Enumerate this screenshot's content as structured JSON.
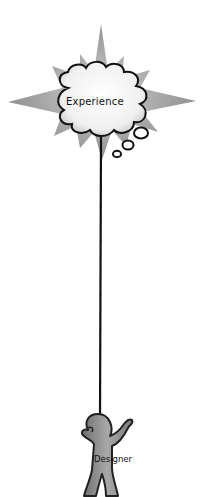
{
  "diagram": {
    "thought_bubble": {
      "label": "Experience"
    },
    "figure": {
      "label": "Designer"
    },
    "colors": {
      "starburst": "#9a9a9a",
      "cloud_fill": "#f4f4f4",
      "outline": "#111111",
      "figure_fill": "#8c8c8c"
    }
  }
}
